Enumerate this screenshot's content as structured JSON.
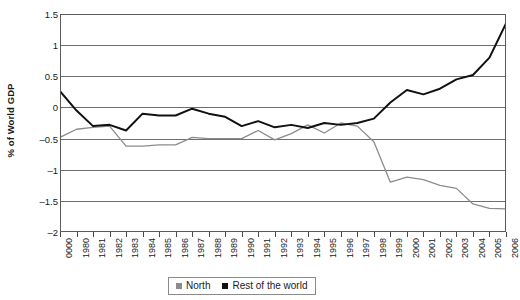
{
  "chart_data": {
    "type": "line",
    "title": "",
    "xlabel": "",
    "ylabel": "% of World GDP",
    "ylim": [
      -2,
      1.5
    ],
    "yticks": [
      1.5,
      1,
      0.5,
      0,
      -0.5,
      -1,
      -1.5,
      -2
    ],
    "ytick_labels": [
      "1.5",
      "1",
      "0.5",
      "0",
      "–0.5",
      "–1",
      "–1.5",
      "–2"
    ],
    "grid": true,
    "legend_position": "bottom-center",
    "categories": [
      "0000",
      "1980",
      "1981",
      "1982",
      "1983",
      "1984",
      "1985",
      "1986",
      "1987",
      "1988",
      "1989",
      "1990",
      "1991",
      "1992",
      "1993",
      "1994",
      "1995",
      "1996",
      "1997",
      "1998",
      "1999",
      "2000",
      "2001",
      "2002",
      "2003",
      "2004",
      "2005",
      "2006"
    ],
    "series": [
      {
        "name": "North",
        "color": "#8c8c8c",
        "values": [
          -0.48,
          -0.35,
          -0.32,
          -0.3,
          -0.62,
          -0.62,
          -0.6,
          -0.6,
          -0.48,
          -0.5,
          -0.5,
          -0.5,
          -0.37,
          -0.52,
          -0.42,
          -0.28,
          -0.41,
          -0.25,
          -0.3,
          -0.55,
          -1.2,
          -1.12,
          -1.16,
          -1.25,
          -1.3,
          -1.55,
          -1.62,
          -1.63
        ]
      },
      {
        "name": "Rest of the world",
        "color": "#111111",
        "values": [
          0.26,
          -0.05,
          -0.3,
          -0.28,
          -0.37,
          -0.1,
          -0.13,
          -0.13,
          -0.02,
          -0.1,
          -0.15,
          -0.3,
          -0.22,
          -0.32,
          -0.28,
          -0.33,
          -0.25,
          -0.28,
          -0.25,
          -0.18,
          0.08,
          0.28,
          0.21,
          0.3,
          0.45,
          0.52,
          0.8,
          1.35
        ]
      }
    ]
  },
  "legend": {
    "entries": [
      {
        "label": "North",
        "color": "#8c8c8c"
      },
      {
        "label": "Rest of the world",
        "color": "#111111"
      }
    ]
  }
}
